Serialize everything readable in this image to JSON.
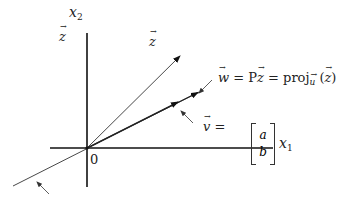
{
  "labels": {
    "x1": "x",
    "x1_sub": "1",
    "x2": "x",
    "x2_sub": "2",
    "origin": "0",
    "z_left": "z",
    "z_top": "z",
    "w_eq": {
      "w": "w",
      "eq1": " = P",
      "z": "z",
      "eq2": " = proj",
      "u": "u",
      "paren_open": " (",
      "z2": "z",
      "paren_close": ")"
    },
    "v_eq": {
      "v": "v",
      "eq": " = ",
      "a": "a",
      "b": "b"
    }
  },
  "colors": {
    "ink": "#222222",
    "axis": "#111111"
  }
}
